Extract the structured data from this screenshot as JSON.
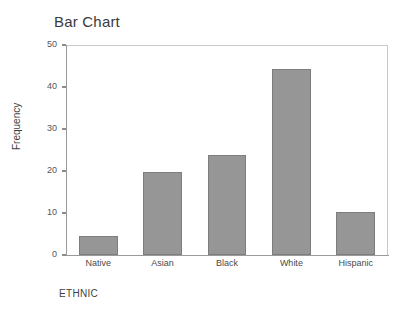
{
  "chart_data": {
    "type": "bar",
    "title": "Bar Chart",
    "xlabel": "ETHNIC",
    "ylabel": "Frequency",
    "categories": [
      "Native",
      "Asian",
      "Black",
      "White",
      "Hispanic"
    ],
    "values": [
      4.5,
      19.7,
      23.8,
      44.3,
      10.2
    ],
    "ylim": [
      0,
      50
    ],
    "yticks": [
      0,
      10,
      20,
      30,
      40,
      50
    ],
    "ytick_labels": [
      "0",
      "10",
      "20",
      "30",
      "40",
      "50"
    ],
    "grid": false,
    "legend": null,
    "bar_color": "#969696",
    "bar_border_color": "#7d7d7d",
    "axis_color": "#9a9a9a",
    "frame_color": "#c9c9c9",
    "text_color": "#3f3f3f"
  }
}
